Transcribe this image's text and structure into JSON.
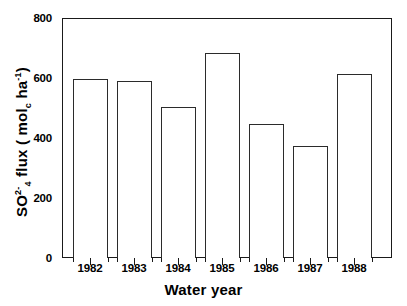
{
  "figure": {
    "top_clipped_caption": "",
    "background_color": "#ffffff",
    "line_color": "#1a1a1a",
    "bar_fill": "#ffffff",
    "bar_stroke": "#2b2b2b"
  },
  "chart_data": {
    "type": "bar",
    "title": "",
    "xlabel": "Water year",
    "ylabel": "SO4 flux ( molc ha-1)",
    "ylabel_parts": {
      "species": "SO",
      "species_sup": "2-",
      "species_sub": "4",
      "word": "flux",
      "unit_open": "(",
      "unit_mol": "mol",
      "unit_mol_sub": "c",
      "unit_ha": "ha",
      "unit_ha_sup": "-1",
      "unit_close": ")"
    },
    "categories": [
      "1982",
      "1983",
      "1984",
      "1985",
      "1986",
      "1987",
      "1988"
    ],
    "values": [
      597,
      590,
      502,
      685,
      447,
      372,
      612
    ],
    "ylim": [
      0,
      800
    ],
    "ymajor_ticks": [
      0,
      200,
      400,
      600,
      800
    ],
    "ymajor_labels": [
      "0",
      "200",
      "400",
      "600",
      "800"
    ],
    "yminor_ticks": [
      100,
      300,
      500,
      700
    ],
    "grid": false,
    "legend": null,
    "legend_position": "none",
    "bar_style": "open-outline"
  }
}
